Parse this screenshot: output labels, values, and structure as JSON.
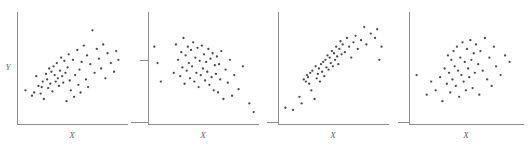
{
  "figure": {
    "title": "",
    "panel_count": 4,
    "marker_color": "#4a4a4a",
    "axis_color": "#8c8c8c",
    "background": "#ffffff"
  },
  "chart_data": [
    {
      "type": "scatter",
      "title": "",
      "xlabel": "X",
      "ylabel": "Y",
      "xlim": [
        0,
        100
      ],
      "ylim": [
        0,
        100
      ],
      "grid": false,
      "legend": null,
      "series": [
        {
          "name": "panel-1",
          "correlation_description": "moderate positive",
          "x": [
            6,
            12,
            14,
            16,
            18,
            20,
            21,
            22,
            23,
            25,
            26,
            27,
            28,
            29,
            30,
            31,
            32,
            33,
            34,
            35,
            36,
            37,
            38,
            39,
            40,
            41,
            42,
            43,
            44,
            45,
            46,
            47,
            48,
            50,
            51,
            52,
            54,
            55,
            56,
            57,
            58,
            60,
            62,
            63,
            64,
            66,
            68,
            70,
            72,
            74,
            76,
            78,
            80,
            82,
            85,
            88,
            90,
            92
          ],
          "y": [
            30,
            25,
            28,
            43,
            34,
            27,
            33,
            38,
            22,
            45,
            40,
            32,
            50,
            36,
            47,
            29,
            52,
            44,
            38,
            55,
            41,
            34,
            48,
            60,
            43,
            37,
            57,
            46,
            20,
            51,
            63,
            39,
            30,
            58,
            24,
            44,
            67,
            35,
            49,
            28,
            56,
            71,
            40,
            62,
            33,
            54,
            85,
            46,
            68,
            59,
            50,
            72,
            41,
            64,
            55,
            47,
            66,
            58
          ]
        }
      ]
    },
    {
      "type": "scatter",
      "title": "",
      "xlabel": "X",
      "ylabel": "",
      "xlim": [
        0,
        100
      ],
      "ylim": [
        0,
        100
      ],
      "grid": false,
      "legend": null,
      "series": [
        {
          "name": "panel-2",
          "correlation_description": "near zero",
          "x": [
            4,
            7,
            10,
            22,
            24,
            26,
            28,
            29,
            30,
            31,
            32,
            33,
            34,
            35,
            36,
            37,
            38,
            39,
            40,
            41,
            42,
            43,
            44,
            45,
            46,
            47,
            48,
            49,
            50,
            51,
            52,
            53,
            54,
            55,
            56,
            57,
            58,
            59,
            60,
            61,
            62,
            63,
            64,
            65,
            66,
            68,
            70,
            72,
            74,
            76,
            78,
            82,
            86,
            92,
            96
          ],
          "y": [
            70,
            55,
            38,
            46,
            72,
            58,
            43,
            65,
            51,
            78,
            36,
            62,
            48,
            70,
            55,
            41,
            67,
            52,
            74,
            38,
            60,
            46,
            69,
            33,
            57,
            44,
            71,
            50,
            63,
            39,
            56,
            47,
            68,
            35,
            59,
            42,
            64,
            30,
            53,
            45,
            61,
            28,
            54,
            40,
            66,
            22,
            49,
            37,
            58,
            25,
            44,
            31,
            52,
            18,
            10
          ]
        }
      ]
    },
    {
      "type": "scatter",
      "title": "",
      "xlabel": "X",
      "ylabel": "",
      "xlim": [
        0,
        100
      ],
      "ylim": [
        0,
        100
      ],
      "grid": false,
      "legend": null,
      "series": [
        {
          "name": "panel-3",
          "correlation_description": "strong positive",
          "x": [
            5,
            12,
            18,
            20,
            22,
            24,
            25,
            26,
            27,
            28,
            29,
            30,
            32,
            33,
            34,
            35,
            36,
            37,
            38,
            39,
            40,
            41,
            42,
            43,
            44,
            45,
            46,
            47,
            48,
            49,
            50,
            51,
            52,
            53,
            54,
            55,
            56,
            57,
            58,
            60,
            62,
            64,
            66,
            68,
            70,
            72,
            75,
            78,
            80,
            84,
            88,
            90,
            92,
            94
          ],
          "y": [
            14,
            12,
            24,
            18,
            40,
            38,
            44,
            42,
            36,
            46,
            30,
            48,
            22,
            52,
            41,
            45,
            50,
            38,
            54,
            47,
            56,
            43,
            58,
            51,
            62,
            49,
            60,
            55,
            66,
            52,
            64,
            58,
            70,
            61,
            54,
            68,
            75,
            63,
            72,
            65,
            78,
            70,
            60,
            74,
            80,
            68,
            76,
            88,
            72,
            82,
            78,
            86,
            58,
            70
          ]
        }
      ]
    },
    {
      "type": "scatter",
      "title": "",
      "xlabel": "X",
      "ylabel": "",
      "xlim": [
        0,
        100
      ],
      "ylim": [
        0,
        100
      ],
      "grid": false,
      "legend": null,
      "series": [
        {
          "name": "panel-4",
          "correlation_description": "weak to moderate positive",
          "x": [
            5,
            14,
            18,
            22,
            26,
            28,
            30,
            32,
            33,
            34,
            35,
            36,
            37,
            38,
            39,
            40,
            41,
            42,
            43,
            44,
            45,
            46,
            47,
            48,
            49,
            50,
            51,
            52,
            53,
            54,
            55,
            56,
            57,
            58,
            60,
            61,
            62,
            64,
            66,
            68,
            70,
            72,
            74,
            76,
            80,
            84,
            88
          ],
          "y": [
            44,
            26,
            38,
            30,
            42,
            20,
            50,
            36,
            62,
            46,
            28,
            58,
            40,
            66,
            52,
            34,
            70,
            48,
            24,
            60,
            44,
            74,
            38,
            56,
            30,
            68,
            50,
            42,
            76,
            58,
            32,
            64,
            46,
            72,
            54,
            26,
            66,
            48,
            78,
            40,
            60,
            34,
            70,
            52,
            44,
            62,
            56
          ]
        }
      ]
    }
  ],
  "panels": [
    {
      "id": "panel-1",
      "xlabel": "X",
      "ylabel": "Y",
      "has_ylabel": true,
      "has_left_tick": false
    },
    {
      "id": "panel-2",
      "xlabel": "X",
      "ylabel": "",
      "has_ylabel": false,
      "has_left_tick": true
    },
    {
      "id": "panel-3",
      "xlabel": "X",
      "ylabel": "",
      "has_ylabel": false,
      "has_left_tick": false
    },
    {
      "id": "panel-4",
      "xlabel": "X",
      "ylabel": "",
      "has_ylabel": false,
      "has_left_tick": true
    }
  ]
}
